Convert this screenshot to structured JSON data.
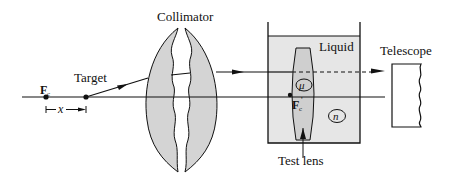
{
  "diagram": {
    "labels": {
      "collimator": "Collimator",
      "target": "Target",
      "liquid": "Liquid",
      "telescope": "Telescope",
      "test_lens": "Test lens",
      "focal_point": "F",
      "focal_sub": "c",
      "focal_prime_point": "F",
      "focal_prime_sub": "c",
      "focal_prime_mark": "'",
      "distance": "x",
      "mu": "μ",
      "n": "n"
    },
    "colors": {
      "lens_fill": "#d4d4d4",
      "liquid_fill": "#e6e6e6",
      "test_lens_fill": "#cfcfcf",
      "line": "#111111"
    }
  }
}
